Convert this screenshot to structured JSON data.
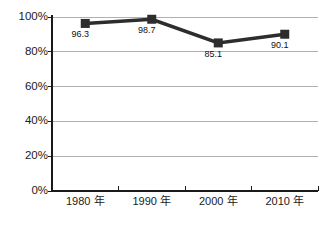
{
  "colors": {
    "line": "#2d2d2d",
    "marker": "#2d2d2d",
    "grid": "#b0b0b0",
    "axis": "#1a1a1a",
    "text": "#1a1a1a",
    "background": "#ffffff"
  },
  "chart_data": {
    "type": "line",
    "title": "",
    "xlabel": "",
    "ylabel": "",
    "categories": [
      "1980 年",
      "1990 年",
      "2000 年",
      "2010 年"
    ],
    "values": [
      96.3,
      98.7,
      85.1,
      90.1
    ],
    "data_labels": [
      "96.3",
      "98.7",
      "85.1",
      "90.1"
    ],
    "y_tick_labels": [
      "100%",
      "80%",
      "60%",
      "40%",
      "20%",
      "0%"
    ],
    "ylim": [
      0,
      100
    ],
    "y_tick_interval": 20,
    "grid": "horizontal",
    "legend": "none",
    "marker": "square"
  }
}
